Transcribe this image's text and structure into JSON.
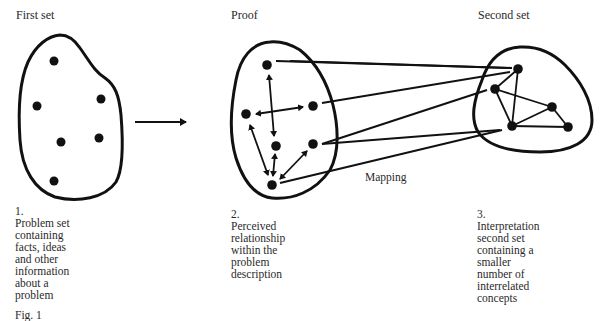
{
  "panels": [
    {
      "title": "First set",
      "number": "1.",
      "caption_lines": [
        "Problem set",
        "containing",
        "facts, ideas",
        "and other",
        "information",
        "about a",
        "problem"
      ]
    },
    {
      "title": "Proof",
      "number": "2.",
      "caption_lines": [
        "Perceived",
        "relationship",
        "within the",
        "problem",
        "description"
      ]
    },
    {
      "title": "Second set",
      "number": "3.",
      "caption_lines": [
        "Interpretation",
        "second set",
        "containing a",
        "smaller",
        "number of",
        "interrelated",
        "concepts"
      ]
    }
  ],
  "mapping_label": "Mapping",
  "figure_label": "Fig. 1",
  "colors": {
    "ink": "#111111",
    "text": "#2a2a2a",
    "background": "#ffffff"
  },
  "nodes": {
    "first_set": [
      [
        54,
        61
      ],
      [
        37,
        106
      ],
      [
        101,
        99
      ],
      [
        61,
        142
      ],
      [
        99,
        138
      ],
      [
        54,
        181
      ]
    ],
    "proof": [
      [
        267,
        65
      ],
      [
        246,
        114
      ],
      [
        313,
        106
      ],
      [
        276,
        146
      ],
      [
        313,
        144
      ],
      [
        272,
        185
      ]
    ],
    "second_set": [
      [
        518,
        69
      ],
      [
        495,
        89
      ],
      [
        552,
        107
      ],
      [
        512,
        126
      ],
      [
        568,
        127
      ]
    ]
  }
}
